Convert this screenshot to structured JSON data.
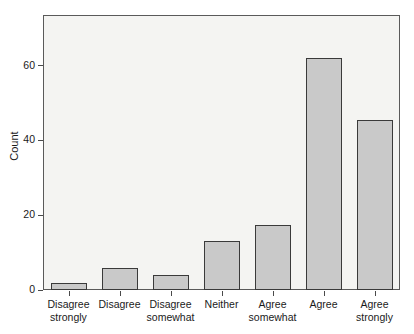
{
  "chart_data": {
    "type": "bar",
    "title": "",
    "subtitle": "",
    "xlabel": "",
    "ylabel": "Count",
    "categories": [
      "Disagree strongly",
      "Disagree",
      "Disagree somewhat",
      "Neither",
      "Agree somewhat",
      "Agree",
      "Agree strongly"
    ],
    "category_lines": [
      [
        "Disagree",
        "strongly"
      ],
      [
        "Disagree",
        ""
      ],
      [
        "Disagree",
        "somewhat"
      ],
      [
        "Neither",
        ""
      ],
      [
        "Agree",
        "somewhat"
      ],
      [
        "Agree",
        ""
      ],
      [
        "Agree",
        "strongly"
      ]
    ],
    "values": [
      2,
      6,
      4,
      13,
      17.5,
      62,
      45.5
    ],
    "ylim": [
      0,
      73.5
    ],
    "yticks": [
      0,
      20,
      40,
      60
    ],
    "ytick_labels": [
      "0",
      "20",
      "40",
      "60"
    ],
    "grid": false,
    "legend": "none",
    "bar_fill_color": "#c9c9c9",
    "bar_border_color": "#3a3a3a",
    "panel_background_color": "#f4f4f2",
    "panel_border_color": "#5a5a5a",
    "text_color": "#1a1a1a"
  }
}
